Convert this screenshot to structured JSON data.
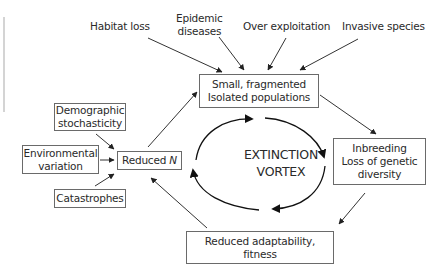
{
  "diagram": {
    "title": "Extinction vortex",
    "center_label": [
      "EXTINCTION",
      "VORTEX"
    ],
    "threats": [
      {
        "id": "habitat-loss",
        "lines": [
          "Habitat loss"
        ]
      },
      {
        "id": "epidemic-diseases",
        "lines": [
          "Epidemic",
          "diseases"
        ]
      },
      {
        "id": "over-exploitation",
        "lines": [
          "Over exploitation"
        ]
      },
      {
        "id": "invasive-species",
        "lines": [
          "Invasive species"
        ]
      }
    ],
    "cycle_nodes": [
      {
        "id": "small-fragmented",
        "lines": [
          "Small, fragmented",
          "Isolated populations"
        ]
      },
      {
        "id": "inbreeding",
        "lines": [
          "Inbreeding",
          "Loss of genetic",
          "diversity"
        ]
      },
      {
        "id": "reduced-adaptability",
        "lines": [
          "Reduced adaptability,",
          "fitness"
        ]
      },
      {
        "id": "reduced-n",
        "label": "Reduced ",
        "italic": "N"
      }
    ],
    "stochastic_factors": [
      {
        "id": "demographic-stochasticity",
        "lines": [
          "Demographic",
          "stochasticity"
        ]
      },
      {
        "id": "environmental-variation",
        "lines": [
          "Environmental",
          "variation"
        ]
      },
      {
        "id": "catastrophes",
        "lines": [
          "Catastrophes"
        ]
      }
    ],
    "edges": [
      {
        "from": "habitat-loss",
        "to": "small-fragmented"
      },
      {
        "from": "epidemic-diseases",
        "to": "small-fragmented"
      },
      {
        "from": "over-exploitation",
        "to": "small-fragmented"
      },
      {
        "from": "invasive-species",
        "to": "small-fragmented"
      },
      {
        "from": "small-fragmented",
        "to": "inbreeding"
      },
      {
        "from": "inbreeding",
        "to": "reduced-adaptability"
      },
      {
        "from": "reduced-adaptability",
        "to": "reduced-n"
      },
      {
        "from": "reduced-n",
        "to": "small-fragmented"
      },
      {
        "from": "demographic-stochasticity",
        "to": "reduced-n"
      },
      {
        "from": "environmental-variation",
        "to": "reduced-n"
      },
      {
        "from": "catastrophes",
        "to": "reduced-n"
      }
    ],
    "colors": {
      "line": "#333333",
      "box_border": "#6a6a6a",
      "text": "#2a2a2a"
    }
  }
}
